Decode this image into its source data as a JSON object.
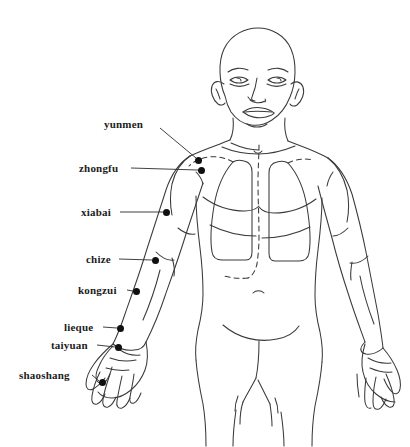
{
  "figure": {
    "background_color": "#ffffff",
    "ink_color": "#3a3a3a",
    "label_color": "#1c1c1c",
    "point_color": "#101010",
    "width": 410,
    "height": 447
  },
  "acupoints": [
    {
      "id": "yunmen",
      "label": "yunmen",
      "dot": {
        "x": 198,
        "y": 160
      },
      "label_pos": {
        "x": 104,
        "y": 124
      },
      "leader": {
        "x1": 160,
        "y1": 128,
        "x2": 196,
        "y2": 158
      },
      "label_align": "left"
    },
    {
      "id": "zhongfu",
      "label": "zhongfu",
      "dot": {
        "x": 201,
        "y": 170
      },
      "label_pos": {
        "x": 79,
        "y": 168
      },
      "leader": {
        "x1": 131,
        "y1": 168,
        "x2": 198,
        "y2": 170
      },
      "label_align": "left"
    },
    {
      "id": "xiabai",
      "label": "xiabai",
      "dot": {
        "x": 166,
        "y": 212
      },
      "label_pos": {
        "x": 81,
        "y": 212
      },
      "leader": {
        "x1": 120,
        "y1": 212,
        "x2": 163,
        "y2": 212
      },
      "label_align": "left"
    },
    {
      "id": "chize",
      "label": "chize",
      "dot": {
        "x": 155,
        "y": 260
      },
      "label_pos": {
        "x": 86,
        "y": 259
      },
      "leader": {
        "x1": 119,
        "y1": 259,
        "x2": 152,
        "y2": 260
      },
      "label_align": "left"
    },
    {
      "id": "kongzui",
      "label": "kongzui",
      "dot": {
        "x": 136,
        "y": 291
      },
      "label_pos": {
        "x": 78,
        "y": 290
      },
      "leader": {
        "x1": 127,
        "y1": 290,
        "x2": 133,
        "y2": 291
      },
      "label_align": "left"
    },
    {
      "id": "lieque",
      "label": "lieque",
      "dot": {
        "x": 120,
        "y": 328
      },
      "label_pos": {
        "x": 64,
        "y": 327
      },
      "leader": {
        "x1": 103,
        "y1": 327,
        "x2": 117,
        "y2": 328
      },
      "label_align": "left"
    },
    {
      "id": "taiyuan",
      "label": "taiyuan",
      "dot": {
        "x": 118,
        "y": 347
      },
      "label_pos": {
        "x": 51,
        "y": 345
      },
      "leader": {
        "x1": 97,
        "y1": 345,
        "x2": 115,
        "y2": 347
      },
      "label_align": "left"
    },
    {
      "id": "shaoshang",
      "label": "shaoshang",
      "dot": {
        "x": 102,
        "y": 382
      },
      "label_pos": {
        "x": 19,
        "y": 375
      },
      "leader": {
        "x1": 92,
        "y1": 375,
        "x2": 99,
        "y2": 381
      },
      "label_align": "left"
    }
  ]
}
